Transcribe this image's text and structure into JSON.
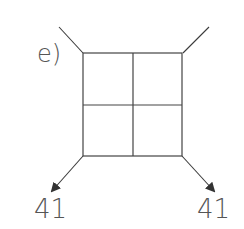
{
  "diagram": {
    "label": "e)",
    "grid": {
      "rows": 2,
      "cols": 2
    },
    "outputs": [
      {
        "id": "bottom-left",
        "value": "41"
      },
      {
        "id": "bottom-right",
        "value": "41"
      }
    ],
    "colors": {
      "stroke": "#3a3a3a",
      "text": "#555555"
    }
  }
}
